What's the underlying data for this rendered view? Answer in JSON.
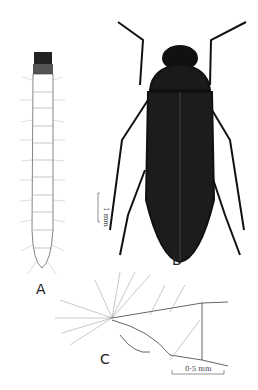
{
  "figure": {
    "panels": [
      {
        "id": "A",
        "label": "A",
        "subject": "larva, dorsal view"
      },
      {
        "id": "B",
        "label": "B",
        "subject": "adult beetle, dorsal view"
      },
      {
        "id": "C",
        "label": "C",
        "subject": "larval abdominal apex, lateral view"
      }
    ],
    "scale_bars": [
      {
        "panel": "B",
        "text": "1 mm"
      },
      {
        "panel": "C",
        "text": "0·5 mm"
      }
    ]
  },
  "colors": {
    "ink": "#111111",
    "paper": "#ffffff"
  }
}
